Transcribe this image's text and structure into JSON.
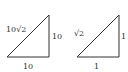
{
  "diagram": {
    "stroke_color": "#333333",
    "triangles": [
      {
        "name": "triangle-large",
        "vertices": [
          [
            7,
            57
          ],
          [
            49,
            15
          ],
          [
            49,
            57
          ]
        ],
        "labels": {
          "hypotenuse": "10√2",
          "vertical_leg": "10",
          "horizontal_leg": "10"
        }
      },
      {
        "name": "triangle-unit",
        "vertices": [
          [
            77,
            57
          ],
          [
            119,
            15
          ],
          [
            119,
            57
          ]
        ],
        "labels": {
          "hypotenuse": "√2",
          "vertical_leg": "1",
          "horizontal_leg": "1"
        }
      }
    ]
  }
}
